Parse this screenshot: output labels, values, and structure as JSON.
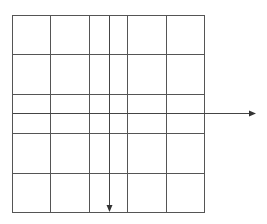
{
  "diagram": {
    "type": "grid-with-arrows",
    "grid": {
      "columns": 5,
      "rows": 5,
      "line_color": "#555555"
    },
    "arrows": [
      {
        "name": "horizontal-arrow",
        "direction": "right",
        "crosses": "middle-row",
        "extends_beyond_grid": true
      },
      {
        "name": "vertical-arrow",
        "direction": "down",
        "crosses": "middle-column",
        "extends_beyond_grid": false
      }
    ],
    "arrow_color": "#333333"
  }
}
